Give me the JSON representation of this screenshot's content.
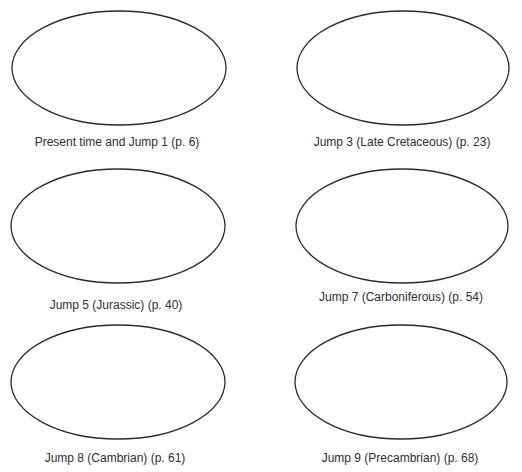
{
  "page": {
    "cut_off_heading": ""
  },
  "style": {
    "stroke_color": "#2b2b2b",
    "fill_color": "#ffffff",
    "label_color": "#2e2e2e"
  },
  "panels": [
    {
      "label": "Present time and Jump 1 (p. 6)",
      "ellipse": {
        "cx": 119,
        "cy": 68,
        "rx": 107,
        "ry": 57
      },
      "label_pos": {
        "x": 117,
        "y": 135
      }
    },
    {
      "label": "Jump 3 (Late Cretaceous) (p. 23)",
      "ellipse": {
        "cx": 403,
        "cy": 68,
        "rx": 106,
        "ry": 57
      },
      "label_pos": {
        "x": 402,
        "y": 135
      }
    },
    {
      "label": "Jump 5 (Jurassic) (p. 40)",
      "ellipse": {
        "cx": 118,
        "cy": 226,
        "rx": 107,
        "ry": 57
      },
      "label_pos": {
        "x": 116,
        "y": 298
      }
    },
    {
      "label": "Jump 7 (Carboniferous) (p. 54)",
      "ellipse": {
        "cx": 402,
        "cy": 226,
        "rx": 106,
        "ry": 57
      },
      "label_pos": {
        "x": 401,
        "y": 290
      }
    },
    {
      "label": "Jump 8 (Cambrian) (p. 61)",
      "ellipse": {
        "cx": 118,
        "cy": 382,
        "rx": 107,
        "ry": 57
      },
      "label_pos": {
        "x": 115,
        "y": 451
      }
    },
    {
      "label": "Jump 9 (Precambrian) (p. 68)",
      "ellipse": {
        "cx": 401,
        "cy": 382,
        "rx": 106,
        "ry": 57
      },
      "label_pos": {
        "x": 400,
        "y": 451
      }
    }
  ]
}
